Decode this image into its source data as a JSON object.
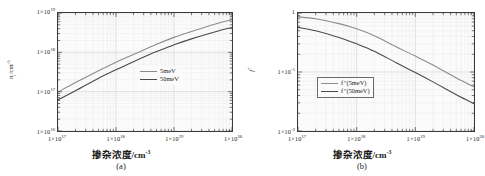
{
  "figure": {
    "panels": [
      {
        "id": "a",
        "caption": "(a)",
        "xaxis_title_main": "掺杂浓度",
        "xaxis_title_unit": "/cm",
        "xaxis_title_unit_exp": "-3",
        "yaxis_title_main": "n",
        "yaxis_title_sub": "i",
        "yaxis_title_unit": "/cm",
        "yaxis_title_unit_exp": "-3",
        "legend_boxed": false,
        "legend": [
          {
            "label": "5meV",
            "color": "#8c8c8c"
          },
          {
            "label": "50meV",
            "color": "#4a4a4a"
          }
        ],
        "ytick_labels": [
          {
            "mant": "1×10",
            "exp": "19"
          },
          {
            "mant": "1×10",
            "exp": "18"
          },
          {
            "mant": "1×10",
            "exp": "17"
          },
          {
            "mant": "1×10",
            "exp": "16"
          }
        ],
        "xtick_labels": [
          {
            "mant": "1×10",
            "exp": "17"
          },
          {
            "mant": "1×10",
            "exp": "18"
          },
          {
            "mant": "1×10",
            "exp": "19"
          },
          {
            "mant": "1×10",
            "exp": "20"
          }
        ]
      },
      {
        "id": "b",
        "caption": "(b)",
        "xaxis_title_main": "掺杂浓度",
        "xaxis_title_unit": "/cm",
        "xaxis_title_unit_exp": "-3",
        "yaxis_title_main": "f",
        "yaxis_title_sup": "+",
        "yaxis_title_sub": "",
        "yaxis_title_unit": "",
        "yaxis_title_unit_exp": "",
        "legend_boxed": true,
        "legend": [
          {
            "label": "f⁺(5meV)",
            "color": "#8c8c8c"
          },
          {
            "label": "f⁺(50meV)",
            "color": "#4a4a4a"
          }
        ],
        "ytick_labels": [
          {
            "mant": "1",
            "exp": ""
          },
          {
            "mant": "1×10",
            "exp": "-1"
          },
          {
            "mant": "1×10",
            "exp": "-2"
          }
        ],
        "xtick_labels": [
          {
            "mant": "1×10",
            "exp": "17"
          },
          {
            "mant": "1×10",
            "exp": "18"
          },
          {
            "mant": "1×10",
            "exp": "19"
          },
          {
            "mant": "1×10",
            "exp": "20"
          }
        ]
      }
    ]
  },
  "chart_data": [
    {
      "type": "line",
      "panel": "a",
      "title": "",
      "xlabel": "掺杂浓度/cm^-3",
      "ylabel": "n_i/cm^-3",
      "xscale": "log",
      "yscale": "log",
      "xlim": [
        1e+17,
        1e+20
      ],
      "ylim": [
        1e+16,
        1e+19
      ],
      "grid": true,
      "legend_position": "right-middle",
      "x": [
        1e+17,
        2e+17,
        5e+17,
        1e+18,
        2e+18,
        5e+18,
        1e+19,
        2e+19,
        5e+19,
        1e+20
      ],
      "series": [
        {
          "name": "5meV",
          "color": "#8c8c8c",
          "values": [
            9.8e+16,
            1.7e+17,
            3.4e+17,
            5.6e+17,
            8.8e+17,
            1.6e+18,
            2.4e+18,
            3.4e+18,
            5.2e+18,
            6.8e+18
          ]
        },
        {
          "name": "50meV",
          "color": "#4a4a4a",
          "values": [
            6.2e+16,
            1.05e+17,
            2.2e+17,
            3.6e+17,
            5.8e+17,
            1.05e+18,
            1.55e+18,
            2.2e+18,
            3.3e+18,
            4.3e+18
          ]
        }
      ]
    },
    {
      "type": "line",
      "panel": "b",
      "title": "",
      "xlabel": "掺杂浓度/cm^-3",
      "ylabel": "f^+",
      "xscale": "log",
      "yscale": "log",
      "xlim": [
        1e+17,
        1e+20
      ],
      "ylim": [
        0.01,
        1
      ],
      "grid": true,
      "legend_position": "left-middle",
      "x": [
        1e+17,
        2e+17,
        5e+17,
        1e+18,
        2e+18,
        5e+18,
        1e+19,
        2e+19,
        5e+19,
        1e+20
      ],
      "series": [
        {
          "name": "f⁺(5meV)",
          "color": "#8c8c8c",
          "values": [
            0.86,
            0.8,
            0.66,
            0.54,
            0.41,
            0.26,
            0.186,
            0.131,
            0.079,
            0.056
          ]
        },
        {
          "name": "f⁺(50meV)",
          "color": "#4a4a4a",
          "values": [
            0.57,
            0.5,
            0.385,
            0.3,
            0.225,
            0.139,
            0.098,
            0.068,
            0.041,
            0.029
          ]
        }
      ]
    }
  ]
}
